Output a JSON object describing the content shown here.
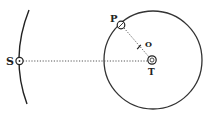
{
  "diagram": {
    "labels": {
      "sun": "S",
      "planet": "P",
      "earth": "T",
      "orbit_point": "O"
    },
    "colors": {
      "ink": "#222222",
      "background": "#ffffff"
    },
    "elements": {
      "outer_arc": "arc through S",
      "orbit_circle": "circle centered at T",
      "line_s_t": "dotted line S to T",
      "line_p_t": "dotted line P to T"
    }
  }
}
